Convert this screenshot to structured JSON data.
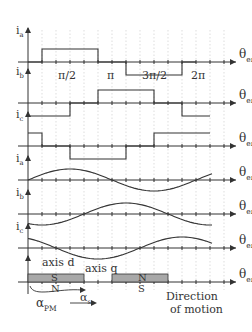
{
  "diagram": {
    "type": "bldc_phase_current_waveforms",
    "colors": {
      "ink": "#333333",
      "grid": "#c8c8c8",
      "magnet": "#a8a8a8"
    },
    "x_axis": {
      "label": "θ",
      "label_sub": "er",
      "ticks_per_period": 12,
      "tick_labels": [
        {
          "at": 3,
          "text": "π/2"
        },
        {
          "at": 6,
          "text": "π"
        },
        {
          "at": 9,
          "text": "3π/2"
        },
        {
          "at": 12,
          "text": "2π"
        }
      ]
    },
    "square_traces": [
      {
        "label": "i",
        "sub": "a",
        "segments": [
          [
            0,
            1,
            0
          ],
          [
            1,
            5,
            1
          ],
          [
            5,
            7,
            0
          ],
          [
            7,
            11,
            -1
          ],
          [
            11,
            12,
            0
          ]
        ]
      },
      {
        "label": "i",
        "sub": "b",
        "segments": [
          [
            0,
            3,
            -1
          ],
          [
            3,
            5,
            0
          ],
          [
            5,
            9,
            1
          ],
          [
            9,
            11,
            0
          ],
          [
            11,
            13,
            -1
          ]
        ]
      },
      {
        "label": "i",
        "sub": "c",
        "segments": [
          [
            0,
            1,
            1
          ],
          [
            1,
            3,
            0
          ],
          [
            3,
            7,
            -1
          ],
          [
            7,
            9,
            0
          ],
          [
            9,
            13,
            1
          ]
        ]
      }
    ],
    "sine_traces": [
      {
        "label": "i",
        "sub": "a",
        "phase_deg": 0
      },
      {
        "label": "i",
        "sub": "b",
        "phase_deg": -120
      },
      {
        "label": "i",
        "sub": "c",
        "phase_deg": 120
      }
    ],
    "magnet_row": {
      "axis_d": "axis d",
      "axis_q": "axis q",
      "pole1_top": "S",
      "pole1_bottom": "N",
      "pole2_top": "N",
      "pole2_bottom": "S",
      "alpha_pm": "α",
      "alpha_pm_sub": "PM",
      "alpha_s": "α",
      "alpha_s_sub": "s"
    },
    "direction_label_1": "Direction",
    "direction_label_2": "of motion"
  }
}
